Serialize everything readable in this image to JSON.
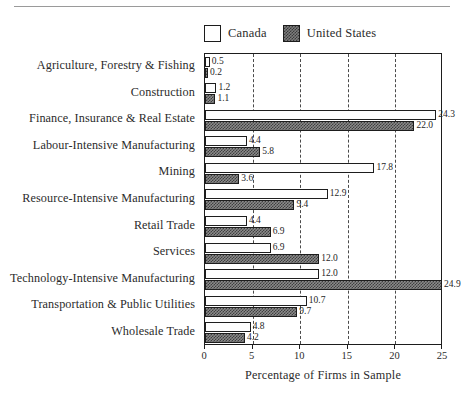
{
  "chart_data": {
    "type": "bar",
    "orientation": "horizontal",
    "title": "",
    "xlabel": "Percentage of Firms in Sample",
    "ylabel": "",
    "xlim": [
      0,
      25
    ],
    "xticks": [
      0,
      5,
      10,
      15,
      20,
      25
    ],
    "grid": true,
    "legend_position": "top-right",
    "categories": [
      "Agriculture, Forestry & Fishing",
      "Construction",
      "Finance, Insurance & Real Estate",
      "Labour-Intensive Manufacturing",
      "Mining",
      "Resource-Intensive Manufacturing",
      "Retail Trade",
      "Services",
      "Technology-Intensive Manufacturing",
      "Transportation & Public Utilities",
      "Wholesale Trade"
    ],
    "series": [
      {
        "name": "Canada",
        "fill": "white",
        "values": [
          0.5,
          1.2,
          24.3,
          4.4,
          17.8,
          12.9,
          4.4,
          6.9,
          12.0,
          10.7,
          4.8
        ],
        "labels": [
          "0.5",
          "1.2",
          "24.3",
          "4.4",
          "17.8",
          "12.9",
          "4.4",
          "6.9",
          "12.0",
          "10.7",
          "4.8"
        ]
      },
      {
        "name": "United States",
        "fill": "checkered-dark",
        "values": [
          0.2,
          1.1,
          22.0,
          5.8,
          3.6,
          9.4,
          6.9,
          12.0,
          24.9,
          9.7,
          4.2
        ],
        "labels": [
          "0.2",
          "1.1",
          "22.0",
          "5.8",
          "3.6",
          "9.4",
          "6.9",
          "12.0",
          "24.9",
          "9.7",
          "4.2"
        ]
      }
    ]
  },
  "legend": {
    "entries": [
      {
        "label": "Canada",
        "swatch": "open-square-icon"
      },
      {
        "label": "United States",
        "swatch": "hatched-square-icon"
      }
    ]
  },
  "colors": {
    "axis": "#1d1d1d",
    "gridline": "#4a4a4a",
    "canada_fill": "#ffffff",
    "us_fill": "#3f3f3f",
    "text": "#2b2b2b"
  }
}
